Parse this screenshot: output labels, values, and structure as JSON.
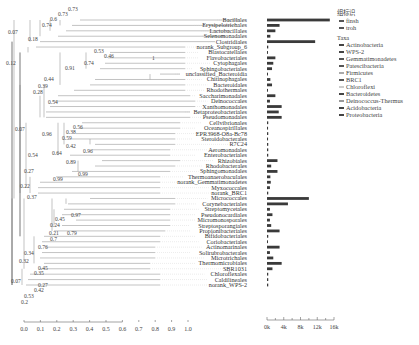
{
  "chart_data": {
    "type": "bar",
    "tree_scale": {
      "ticks": [
        "0.0",
        "0.1",
        "0.2",
        "0.3",
        "0.4",
        "0.5",
        "0.6",
        "0.7",
        "0.8",
        "0.9",
        "1.0"
      ]
    },
    "bar_axis": {
      "ticks": [
        "0k",
        "4k",
        "8k",
        "12k",
        "16k"
      ],
      "xlim": [
        0,
        16000
      ]
    },
    "legend": {
      "group_title": "组标识",
      "groups": [
        "finsh",
        "troh"
      ],
      "taxa_title": "Taxa",
      "taxa": [
        "Actinobacteria",
        "WPS-2",
        "Gemmatimonadetes",
        "Patescibacteria",
        "Firmicutes",
        "BRC1",
        "Chloroflexi",
        "Bacteroidetes",
        "Deinococcus-Thermus",
        "Acidobacteria",
        "Proteobacteria"
      ]
    },
    "categories": [
      "Bacillales",
      "Erysipelotrichales",
      "Lactobacillales",
      "Selenomonadales",
      "Clostridiales",
      "norank_Subgroup_6",
      "Blastocatellales",
      "Flavobacteriales",
      "Cytophagales",
      "Sphingobacteriales",
      "unclassified_Bacteroidia",
      "Chitinophagales",
      "Bacteroidales",
      "Rhodothermales",
      "Saccharimonadales",
      "Deinococcales",
      "Xanthomonadales",
      "Betaproteobacteriales",
      "Pseudomonadales",
      "Cellvibrionales",
      "Oceanospirillales",
      "EPR3968-O8a-Bc78",
      "Steroidobacterales",
      "R7C24",
      "Aeromonadales",
      "Enterobacteriales",
      "Rhizobiales",
      "Rhodobacterales",
      "Sphingomonadales",
      "Thermoanaerobaculales",
      "norank_Gemmatimonadetes",
      "Myxococcales",
      "norank_BRC1",
      "Micrococcales",
      "Corynebacteriales",
      "Streptomycetales",
      "Pseudonocardiales",
      "Micromonosporales",
      "Streptosporangiales",
      "Propionibacteriales",
      "Bifidobacteriales",
      "Coriobacteriales",
      "Actinomarinales",
      "Solirubrobacterales",
      "Microtrichales",
      "Thermomicrobiales",
      "SBR1031",
      "Chloroflexales",
      "Caldilineales",
      "norank_WPS-2"
    ],
    "values": [
      15000,
      3000,
      2000,
      800,
      11500,
      300,
      200,
      2000,
      1500,
      1200,
      150,
      800,
      1200,
      200,
      2000,
      700,
      3500,
      2800,
      3500,
      300,
      250,
      300,
      250,
      300,
      300,
      300,
      2500,
      1000,
      2500,
      800,
      900,
      700,
      300,
      10000,
      5000,
      700,
      1300,
      700,
      1000,
      3000,
      300,
      200,
      3000,
      700,
      1500,
      3500,
      1300,
      300,
      300,
      300
    ],
    "bootstrap_labels": [
      {
        "v": "0.73",
        "x": 68,
        "y": 11
      },
      {
        "v": "0.73",
        "x": 58,
        "y": 16
      },
      {
        "v": "0.6",
        "x": 50,
        "y": 21
      },
      {
        "v": "0.74",
        "x": 42,
        "y": 27
      },
      {
        "v": "0.07",
        "x": 8,
        "y": 34
      },
      {
        "v": "0.18",
        "x": 28,
        "y": 41
      },
      {
        "v": "0.53",
        "x": 94,
        "y": 53
      },
      {
        "v": "0.46",
        "x": 104,
        "y": 58
      },
      {
        "v": "1",
        "x": 152,
        "y": 60
      },
      {
        "v": "0.74",
        "x": 84,
        "y": 65
      },
      {
        "v": "0.12",
        "x": 6,
        "y": 65
      },
      {
        "v": "0.91",
        "x": 65,
        "y": 70
      },
      {
        "v": "0.44",
        "x": 44,
        "y": 81
      },
      {
        "v": "0.39",
        "x": 38,
        "y": 88
      },
      {
        "v": "0.28",
        "x": 33,
        "y": 94
      },
      {
        "v": "0.54",
        "x": 48,
        "y": 104
      },
      {
        "v": "0.07",
        "x": 15,
        "y": 131
      },
      {
        "v": "0.56",
        "x": 73,
        "y": 129
      },
      {
        "v": "0.38",
        "x": 66,
        "y": 134
      },
      {
        "v": "0.96",
        "x": 42,
        "y": 136
      },
      {
        "v": "0.59",
        "x": 62,
        "y": 140
      },
      {
        "v": "0.42",
        "x": 66,
        "y": 148
      },
      {
        "v": "0.96",
        "x": 83,
        "y": 153
      },
      {
        "v": "0.64",
        "x": 52,
        "y": 155
      },
      {
        "v": "0.54",
        "x": 28,
        "y": 157
      },
      {
        "v": "0.89",
        "x": 66,
        "y": 164
      },
      {
        "v": "0.27",
        "x": 24,
        "y": 173
      },
      {
        "v": "0.99",
        "x": 78,
        "y": 176
      },
      {
        "v": "0.99",
        "x": 53,
        "y": 181
      },
      {
        "v": "0.22",
        "x": 20,
        "y": 188
      },
      {
        "v": "0.37",
        "x": 27,
        "y": 199
      },
      {
        "v": "0.97",
        "x": 71,
        "y": 217
      },
      {
        "v": "0.45",
        "x": 55,
        "y": 221
      },
      {
        "v": "0.24",
        "x": 50,
        "y": 227
      },
      {
        "v": "0.21",
        "x": 49,
        "y": 235
      },
      {
        "v": "0.79",
        "x": 67,
        "y": 235
      },
      {
        "v": "0.7",
        "x": 50,
        "y": 241
      },
      {
        "v": "0.76",
        "x": 38,
        "y": 249
      },
      {
        "v": "0.34",
        "x": 24,
        "y": 255
      },
      {
        "v": "0.32",
        "x": 19,
        "y": 263
      },
      {
        "v": "0.45",
        "x": 38,
        "y": 270
      },
      {
        "v": "0.35",
        "x": 34,
        "y": 275
      },
      {
        "v": "0.07",
        "x": 11,
        "y": 283
      },
      {
        "v": "0.27",
        "x": 38,
        "y": 287
      },
      {
        "v": "0.42",
        "x": 34,
        "y": 292
      },
      {
        "v": "0.53",
        "x": 24,
        "y": 298
      },
      {
        "v": "0.2",
        "x": 21,
        "y": 304
      }
    ],
    "xlabel": "",
    "ylabel": "",
    "grid": false,
    "legend_position": "right"
  },
  "colors": {
    "bar": "#3a3a3a",
    "branch": "#9a9a9a",
    "text": "#333333",
    "dotted": "#cfcfcf"
  }
}
